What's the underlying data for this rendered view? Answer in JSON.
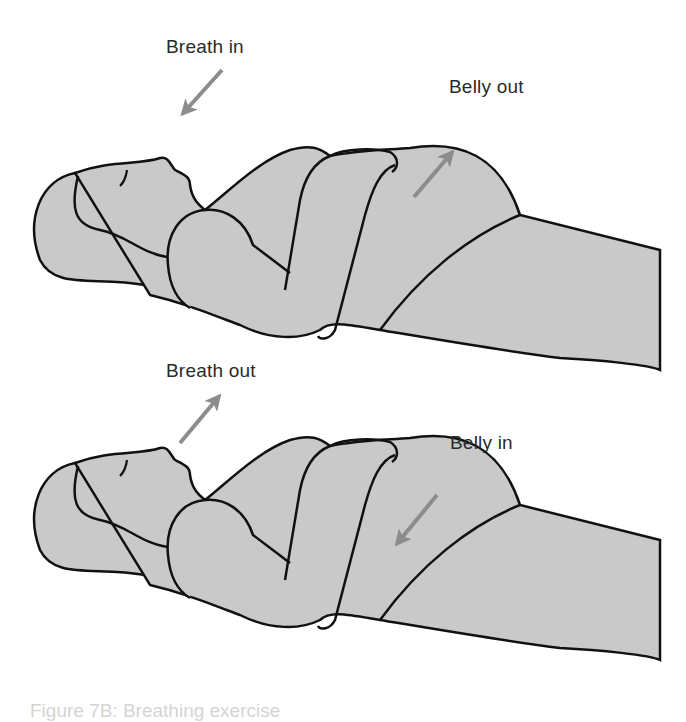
{
  "figure": {
    "panels": [
      {
        "id": "inhale",
        "breath_label": "Breath in",
        "belly_label": "Belly out",
        "breath_arrow": "arrow-down-left (toward mouth)",
        "belly_arrow": "arrow-up-right (belly expanding)"
      },
      {
        "id": "exhale",
        "breath_label": "Breath out",
        "belly_label": "Belly in",
        "breath_arrow": "arrow-up-right (away from mouth)",
        "belly_arrow": "arrow-down-left (belly contracting)"
      }
    ],
    "caption": "Figure 7B: Breathing exercise",
    "colors": {
      "body_fill": "#c9c9c9",
      "outline": "#111111",
      "arrow": "#8c8c8c",
      "text": "#2a2a2a"
    }
  }
}
